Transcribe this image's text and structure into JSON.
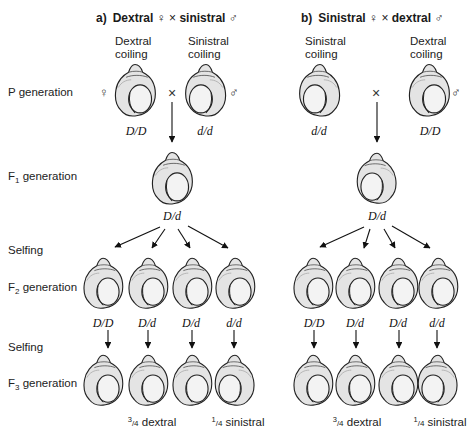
{
  "panels": [
    {
      "id": "a",
      "label": "a)",
      "title_left": "Dextral",
      "female_symbol": "♀",
      "cross_symbol": "×",
      "title_right": "sinistral",
      "male_symbol": "♂",
      "parents": [
        {
          "heading_line1": "Dextral",
          "heading_line2": "coiling",
          "sex_symbol": "♀",
          "genotype": "D/D",
          "coiling": "dextral"
        },
        {
          "heading_line1": "Sinistral",
          "heading_line2": "coiling",
          "sex_symbol": "♂",
          "genotype": "d/d",
          "coiling": "sinistral"
        }
      ],
      "f1": {
        "genotype": "D/d",
        "coiling": "dextral"
      },
      "f2": [
        {
          "genotype": "D/D",
          "coiling": "dextral"
        },
        {
          "genotype": "D/d",
          "coiling": "dextral"
        },
        {
          "genotype": "D/d",
          "coiling": "dextral"
        },
        {
          "genotype": "d/d",
          "coiling": "dextral"
        }
      ],
      "f3": [
        {
          "coiling": "dextral"
        },
        {
          "coiling": "dextral"
        },
        {
          "coiling": "dextral"
        },
        {
          "coiling": "sinistral"
        }
      ],
      "ratio_dextral": {
        "num": "3",
        "den": "/4",
        "text": " dextral"
      },
      "ratio_sinistral": {
        "num": "1",
        "den": "/4",
        "text": " sinistral"
      }
    },
    {
      "id": "b",
      "label": "b)",
      "title_left": "Sinistral",
      "female_symbol": "♀",
      "cross_symbol": "×",
      "title_right": "dextral",
      "male_symbol": "♂",
      "parents": [
        {
          "heading_line1": "Sinistral",
          "heading_line2": "coiling",
          "sex_symbol": "♀",
          "genotype": "d/d",
          "coiling": "sinistral"
        },
        {
          "heading_line1": "Dextral",
          "heading_line2": "coiling",
          "sex_symbol": "♂",
          "genotype": "D/D",
          "coiling": "dextral"
        }
      ],
      "f1": {
        "genotype": "D/d",
        "coiling": "sinistral"
      },
      "f2": [
        {
          "genotype": "D/D",
          "coiling": "dextral"
        },
        {
          "genotype": "D/d",
          "coiling": "dextral"
        },
        {
          "genotype": "D/d",
          "coiling": "dextral"
        },
        {
          "genotype": "d/d",
          "coiling": "dextral"
        }
      ],
      "f3": [
        {
          "coiling": "dextral"
        },
        {
          "coiling": "dextral"
        },
        {
          "coiling": "dextral"
        },
        {
          "coiling": "sinistral"
        }
      ],
      "ratio_dextral": {
        "num": "3",
        "den": "/4",
        "text": " dextral"
      },
      "ratio_sinistral": {
        "num": "1",
        "den": "/4",
        "text": " sinistral"
      }
    }
  ],
  "row_labels": {
    "p": "P generation",
    "f1_prefix": "F",
    "f1_sub": "1",
    "f1_suffix": " generation",
    "selfing_1": "Selfing",
    "f2_prefix": "F",
    "f2_sub": "2",
    "f2_suffix": " generation",
    "selfing_2": "Selfing",
    "f3_prefix": "F",
    "f3_sub": "3",
    "f3_suffix": " generation"
  },
  "colors": {
    "ink": "#1a1a1a",
    "shell_fill": "#e6e6e6",
    "shell_shade": "#c9c9c9",
    "aperture": "#f4f4f4"
  }
}
